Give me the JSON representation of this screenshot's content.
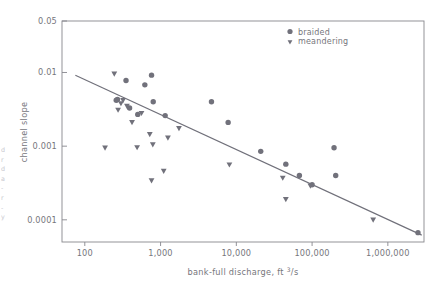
{
  "chart_data": {
    "type": "scatter",
    "title": "",
    "xlabel": "bank-full discharge, ft 3/s",
    "xlabel_main": "bank-full discharge, ft ",
    "xlabel_sup": "3",
    "xlabel_tail": "/s",
    "ylabel": "channel slope",
    "xscale": "log",
    "yscale": "log",
    "xlim": [
      50,
      3000000
    ],
    "ylim": [
      5e-05,
      0.05
    ],
    "grid": false,
    "legend_position": "top-right",
    "xticks": [
      100,
      1000,
      10000,
      100000,
      1000000
    ],
    "xtick_labels": [
      "100",
      "1,000",
      "10,000",
      "100,000",
      "1,000,000"
    ],
    "yticks": [
      0.05,
      0.01,
      0.001,
      0.0001
    ],
    "ytick_labels": [
      "0.05",
      "0.01",
      "0.001",
      "0.0001"
    ],
    "marker_color": "#71717b",
    "line_color": "#70707a",
    "axis_color": "#87878d",
    "text_color": "#76767c",
    "series": [
      {
        "name": "braided",
        "marker": "circle",
        "points": [
          [
            260,
            0.0042
          ],
          [
            270,
            0.0043
          ],
          [
            350,
            0.0078
          ],
          [
            390,
            0.0033
          ],
          [
            500,
            0.0027
          ],
          [
            620,
            0.0068
          ],
          [
            760,
            0.0092
          ],
          [
            800,
            0.004
          ],
          [
            1150,
            0.0026
          ],
          [
            4700,
            0.004
          ],
          [
            7800,
            0.0021
          ],
          [
            21000,
            0.00085
          ],
          [
            45000,
            0.00057
          ],
          [
            68000,
            0.0004
          ],
          [
            100000,
            0.0003
          ],
          [
            195000,
            0.00095
          ],
          [
            205000,
            0.0004
          ],
          [
            2500000,
            6.7e-05
          ]
        ]
      },
      {
        "name": "meandering",
        "marker": "triangle-down",
        "points": [
          [
            185,
            0.00095
          ],
          [
            245,
            0.0096
          ],
          [
            275,
            0.0031
          ],
          [
            300,
            0.0038
          ],
          [
            320,
            0.0042
          ],
          [
            360,
            0.0035
          ],
          [
            420,
            0.0021
          ],
          [
            490,
            0.00096
          ],
          [
            560,
            0.0028
          ],
          [
            720,
            0.00145
          ],
          [
            760,
            0.00034
          ],
          [
            790,
            0.00105
          ],
          [
            1100,
            0.00046
          ],
          [
            1250,
            0.0013
          ],
          [
            1750,
            0.00175
          ],
          [
            8100,
            0.00056
          ],
          [
            41000,
            0.00037
          ],
          [
            45000,
            0.00019
          ],
          [
            95000,
            0.00029
          ],
          [
            640000,
            0.0001
          ]
        ]
      }
    ]
  },
  "legend": {
    "items": [
      {
        "label": "braided",
        "marker": "circle"
      },
      {
        "label": "meandering",
        "marker": "triangle-down"
      }
    ]
  },
  "margin_note": {
    "lines": [
      "d",
      "r",
      "d",
      "a",
      "-",
      "r",
      "-",
      "y"
    ]
  }
}
